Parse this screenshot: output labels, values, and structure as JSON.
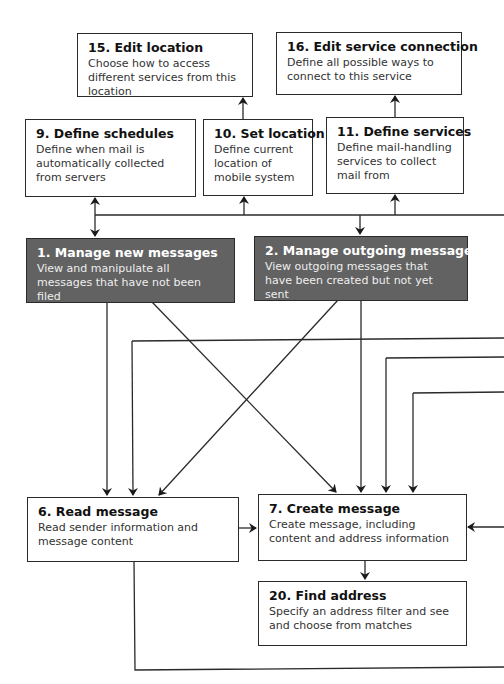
{
  "colors": {
    "line": "#2a2a2a",
    "dark_box_fill": "#626262",
    "light_box_fill": "#ffffff"
  },
  "boxes": {
    "b15": {
      "title": "15. Edit location",
      "desc": "Choose how to access different services from this location"
    },
    "b16": {
      "title": "16. Edit service connection",
      "desc": "Define all possible ways to connect to this service"
    },
    "b9": {
      "title": "9. Define schedules",
      "desc": "Define when mail is automatically collected from servers"
    },
    "b10": {
      "title": "10. Set location",
      "desc": "Define current location of mobile system"
    },
    "b11": {
      "title": "11. Define services",
      "desc": "Define mail-handling services to collect mail from"
    },
    "b1": {
      "title": "1. Manage new messages",
      "desc": "View and manipulate all messages that have not been filed"
    },
    "b2": {
      "title": "2. Manage outgoing messages",
      "desc": "View outgoing messages that have been created but not yet sent"
    },
    "b6": {
      "title": "6. Read message",
      "desc": "Read sender information and message content"
    },
    "b7": {
      "title": "7. Create message",
      "desc": "Create message, including content and address information"
    },
    "b20": {
      "title": "20. Find address",
      "desc": "Specify an address filter and see and choose from matches"
    }
  }
}
